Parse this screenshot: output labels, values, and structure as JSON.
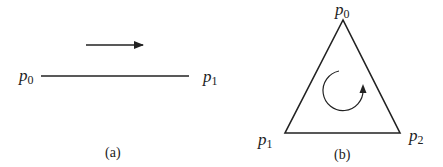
{
  "panel_a": {
    "caption": "(a)",
    "start_label": {
      "base": "p",
      "sub": "0"
    },
    "end_label": {
      "base": "p",
      "sub": "1"
    },
    "direction": "left-to-right"
  },
  "panel_b": {
    "caption": "(b)",
    "vertices": [
      {
        "base": "p",
        "sub": "0",
        "position": "top"
      },
      {
        "base": "p",
        "sub": "1",
        "position": "bottom-left"
      },
      {
        "base": "p",
        "sub": "2",
        "position": "bottom-right"
      }
    ],
    "orientation": "counterclockwise"
  },
  "colors": {
    "stroke": "#222222",
    "background": "#ffffff"
  }
}
